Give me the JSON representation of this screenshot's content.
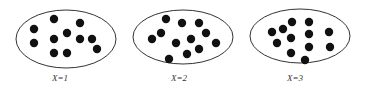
{
  "panels": [
    {
      "label": "X=1",
      "ellipse": {
        "cx": 66,
        "cy": 39,
        "rx": 50,
        "ry": 29
      },
      "label_pos": {
        "x": 60,
        "y": 81
      },
      "dots": [
        [
          34,
          29
        ],
        [
          34,
          43
        ],
        [
          54,
          19
        ],
        [
          54,
          39
        ],
        [
          54,
          53
        ],
        [
          67,
          33
        ],
        [
          67,
          53
        ],
        [
          80,
          23
        ],
        [
          80,
          39
        ],
        [
          92,
          39
        ],
        [
          97,
          49
        ]
      ]
    },
    {
      "label": "X=2",
      "ellipse": {
        "cx": 183,
        "cy": 37,
        "rx": 50,
        "ry": 27
      },
      "label_pos": {
        "x": 179,
        "y": 81
      },
      "dots": [
        [
          166,
          19
        ],
        [
          182,
          23
        ],
        [
          199,
          23
        ],
        [
          206,
          33
        ],
        [
          161,
          33
        ],
        [
          152,
          39
        ],
        [
          191,
          39
        ],
        [
          176,
          43
        ],
        [
          216,
          43
        ],
        [
          199,
          49
        ],
        [
          187,
          54
        ],
        [
          169,
          59
        ]
      ]
    },
    {
      "label": "X=3",
      "ellipse": {
        "cx": 300,
        "cy": 36,
        "rx": 50,
        "ry": 27
      },
      "label_pos": {
        "x": 295,
        "y": 81
      },
      "dots": [
        [
          292,
          22
        ],
        [
          309,
          22
        ],
        [
          283,
          29
        ],
        [
          272,
          32
        ],
        [
          309,
          34
        ],
        [
          329,
          32
        ],
        [
          291,
          38
        ],
        [
          277,
          43
        ],
        [
          309,
          47
        ],
        [
          330,
          47
        ],
        [
          291,
          53
        ],
        [
          305,
          60
        ]
      ]
    }
  ],
  "colors": {
    "dot": "#111111",
    "outline": "#333333",
    "label": "#333333"
  }
}
